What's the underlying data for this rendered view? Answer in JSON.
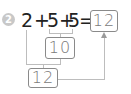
{
  "problem": {
    "number": "2",
    "expression": [
      "2",
      "+",
      "5",
      "+",
      "5",
      "="
    ],
    "answer": "12",
    "intermediate_sum": "10",
    "final_sum": "12"
  },
  "colors": {
    "badge": "#c8c8c8",
    "text": "#222222",
    "box_border": "#8a8a8a",
    "box_text": "#7a7a7a",
    "lines": "#bdbdbd"
  }
}
